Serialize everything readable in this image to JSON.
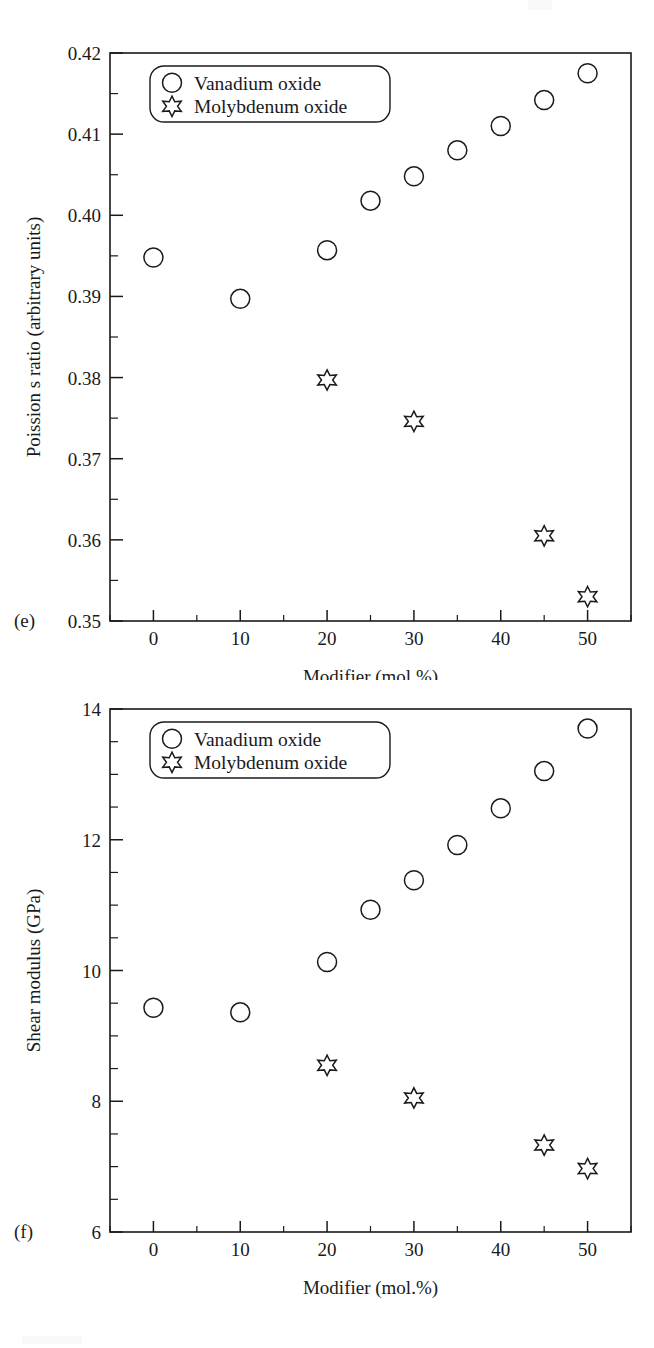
{
  "figure": {
    "background_color": "#ffffff",
    "line_color": "#1a1a1a",
    "marker_color": "#1a1a1a"
  },
  "panels": [
    {
      "id": "e",
      "panel_label": "(e)",
      "legend": {
        "position": "upper-left",
        "entries": [
          {
            "marker": "circle-marker",
            "label": "Vanadium oxide"
          },
          {
            "marker": "star-marker",
            "label": "Molybdenum oxide"
          }
        ]
      },
      "chart_data": {
        "type": "scatter",
        "title": "",
        "xlabel": "Modifier (mol.%)",
        "ylabel": "Poission s ratio (arbitrary units)",
        "xlim": [
          -5,
          55
        ],
        "ylim": [
          0.35,
          0.42
        ],
        "grid": false,
        "legend_position": "upper-left",
        "xticks": [
          0,
          10,
          20,
          30,
          40,
          50
        ],
        "xtick_labels": [
          "0",
          "10",
          "20",
          "30",
          "40",
          "50"
        ],
        "xminor_step": 5,
        "yticks": [
          0.35,
          0.36,
          0.37,
          0.38,
          0.39,
          0.4,
          0.41,
          0.42
        ],
        "ytick_labels": [
          "0.35",
          "0.36",
          "0.37",
          "0.38",
          "0.39",
          "0.40",
          "0.41",
          "0.42"
        ],
        "yminor_step": 0.005,
        "series": [
          {
            "name": "Vanadium oxide",
            "marker": "circle",
            "x": [
              0,
              10,
              20,
              25,
              30,
              35,
              40,
              45,
              50
            ],
            "values": [
              0.3948,
              0.3897,
              0.3957,
              0.4018,
              0.4048,
              0.408,
              0.411,
              0.4142,
              0.4175
            ]
          },
          {
            "name": "Molybdenum oxide",
            "marker": "star",
            "x": [
              20,
              30,
              45,
              50
            ],
            "values": [
              0.3797,
              0.3746,
              0.3605,
              0.353
            ]
          }
        ]
      }
    },
    {
      "id": "f",
      "panel_label": "(f)",
      "legend": {
        "position": "upper-left",
        "entries": [
          {
            "marker": "circle-marker",
            "label": "Vanadium oxide"
          },
          {
            "marker": "star-marker",
            "label": "Molybdenum oxide"
          }
        ]
      },
      "chart_data": {
        "type": "scatter",
        "title": "",
        "xlabel": "Modifier (mol.%)",
        "ylabel": "Shear modulus (GPa)",
        "xlim": [
          -5,
          55
        ],
        "ylim": [
          6,
          14
        ],
        "grid": false,
        "legend_position": "upper-left",
        "xticks": [
          0,
          10,
          20,
          30,
          40,
          50
        ],
        "xtick_labels": [
          "0",
          "10",
          "20",
          "30",
          "40",
          "50"
        ],
        "xminor_step": 5,
        "yticks": [
          6,
          8,
          10,
          12,
          14
        ],
        "ytick_labels": [
          "6",
          "8",
          "10",
          "12",
          "14"
        ],
        "yminor_step": 0.5,
        "series": [
          {
            "name": "Vanadium oxide",
            "marker": "circle",
            "x": [
              0,
              10,
              20,
              25,
              30,
              35,
              40,
              45,
              50
            ],
            "values": [
              9.43,
              9.36,
              10.13,
              10.93,
              11.38,
              11.92,
              12.48,
              13.05,
              13.7
            ]
          },
          {
            "name": "Molybdenum oxide",
            "marker": "star",
            "x": [
              20,
              30,
              45,
              50
            ],
            "values": [
              8.55,
              8.05,
              7.33,
              6.97
            ]
          }
        ]
      }
    }
  ]
}
